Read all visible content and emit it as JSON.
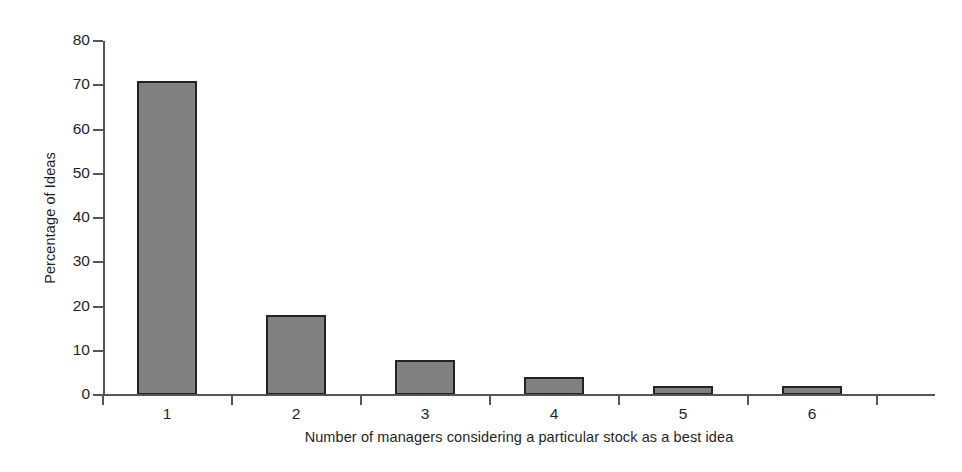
{
  "chart_data": {
    "type": "bar",
    "title": "",
    "xlabel": "Number of managers considering a particular stock as a best idea",
    "ylabel": "Percentage of Ideas",
    "categories": [
      "1",
      "2",
      "3",
      "4",
      "5",
      "6"
    ],
    "values": [
      71,
      18,
      8,
      4,
      2,
      2
    ],
    "series": [
      {
        "name": "Percentage of Ideas",
        "values": [
          71,
          18,
          8,
          4,
          2,
          2
        ]
      }
    ],
    "ylim": [
      0,
      80
    ],
    "ytick_labels": [
      "0",
      "10",
      "20",
      "30",
      "40",
      "50",
      "60",
      "70",
      "80"
    ],
    "ytick_values": [
      0,
      10,
      20,
      30,
      40,
      50,
      60,
      70,
      80
    ],
    "grid": false,
    "legend": "none",
    "bar_fill_color": "#808080",
    "bar_edge_color": "#232323",
    "axis_color": "#555555",
    "background_color": "#ffffff"
  }
}
